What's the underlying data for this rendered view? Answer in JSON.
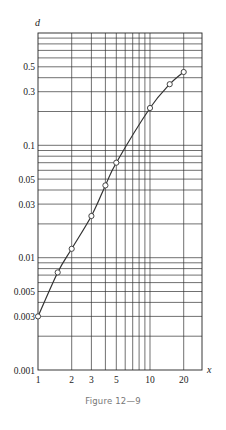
{
  "figure": {
    "caption": "Figure 12—9"
  },
  "chart_data": {
    "type": "line",
    "title": "",
    "xlabel": "x",
    "ylabel": "d",
    "xscale": "log",
    "yscale": "log",
    "xlim": [
      1,
      30
    ],
    "ylim": [
      0.001,
      1
    ],
    "grid": true,
    "x_tick_labels": [
      "1",
      "2",
      "3",
      "5",
      "10",
      "20"
    ],
    "x_tick_values": [
      1,
      2,
      3,
      5,
      10,
      20
    ],
    "x_grid_values": [
      2,
      3,
      4,
      5,
      6,
      7,
      8,
      9,
      10,
      20
    ],
    "y_tick_labels": [
      "0.5",
      "0.3",
      "0.1",
      "0.05",
      "0.03",
      "0.01",
      "0.005",
      "0.003",
      "0.001"
    ],
    "y_tick_values": [
      0.5,
      0.3,
      0.1,
      0.05,
      0.03,
      0.01,
      0.005,
      0.003,
      0.001
    ],
    "y_grid_values": [
      0.002,
      0.003,
      0.004,
      0.005,
      0.006,
      0.007,
      0.008,
      0.009,
      0.01,
      0.02,
      0.03,
      0.04,
      0.05,
      0.06,
      0.07,
      0.08,
      0.09,
      0.1,
      0.2,
      0.3,
      0.4,
      0.5,
      0.6,
      0.7,
      0.8,
      0.9
    ],
    "series": [
      {
        "name": "d vs x",
        "marker": "open-circle",
        "x": [
          1,
          1.5,
          2,
          3,
          4,
          5,
          10,
          15,
          20
        ],
        "y": [
          0.003,
          0.0074,
          0.012,
          0.0235,
          0.044,
          0.07,
          0.215,
          0.35,
          0.45
        ]
      }
    ],
    "legend": null
  }
}
